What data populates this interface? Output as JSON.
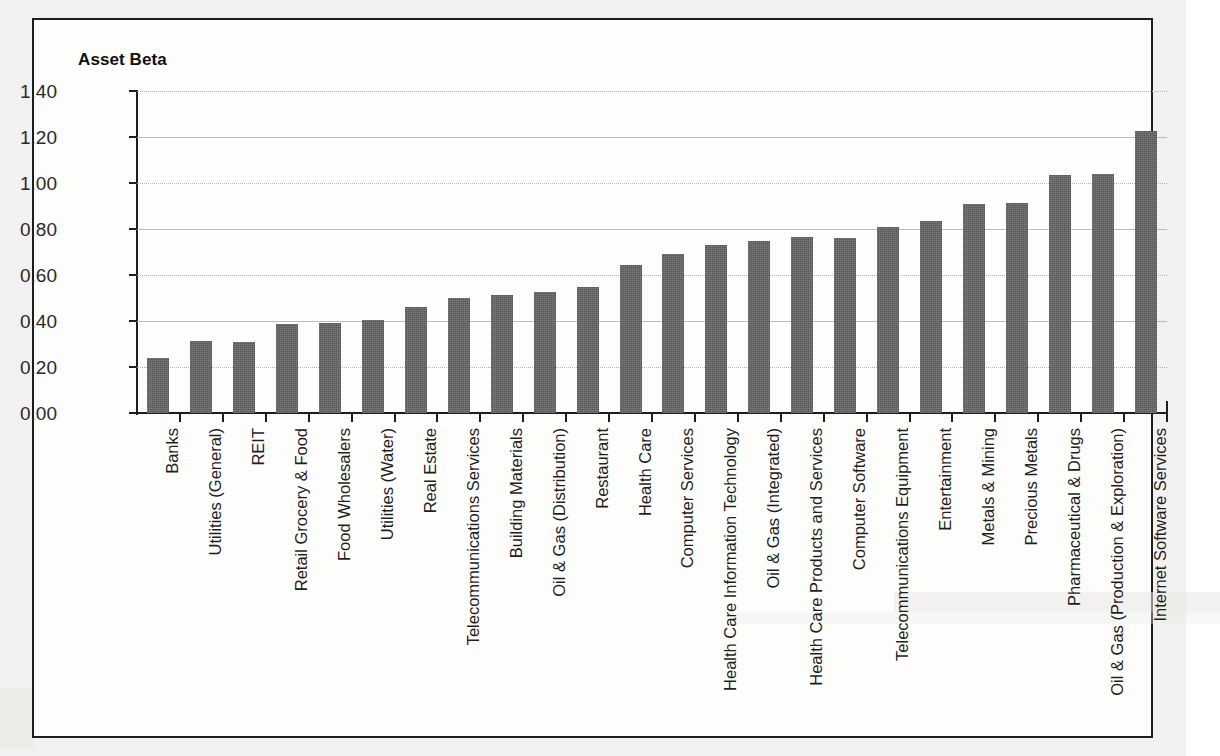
{
  "chart": {
    "title": "Asset Beta"
  },
  "chart_data": {
    "type": "bar",
    "title": "Asset Beta",
    "xlabel": "",
    "ylabel": "Asset Beta",
    "ylim": [
      0.0,
      1.4
    ],
    "ytick_labels": [
      "1.40",
      "1.20",
      "1.00",
      "0.80",
      "0.60",
      "0.40",
      "0.20",
      "0.00"
    ],
    "ytick_values": [
      1.4,
      1.2,
      1.0,
      0.8,
      0.6,
      0.4,
      0.2,
      0.0
    ],
    "grid": true,
    "legend": null,
    "bar_color": "#59585a",
    "categories": [
      "Banks",
      "Utilities (General)",
      "REIT",
      "Retail Grocery & Food",
      "Food Wholesalers",
      "Utilities (Water)",
      "Real Estate",
      "Telecommunications Services",
      "Building Materials",
      "Oil & Gas (Distribution)",
      "Restaurant",
      "Health Care",
      "Computer Services",
      "Health Care Information Technology",
      "Oil & Gas (Integrated)",
      "Health Care Products and Services",
      "Computer Software",
      "Telecommunications Equipment",
      "Entertainment",
      "Metals & Mining",
      "Precious Metals",
      "Pharmaceutical & Drugs",
      "Oil & Gas (Production & Exploration)",
      "Internet Software Services"
    ],
    "values": [
      0.24,
      0.315,
      0.31,
      0.385,
      0.39,
      0.405,
      0.46,
      0.5,
      0.515,
      0.525,
      0.55,
      0.645,
      0.69,
      0.73,
      0.75,
      0.765,
      0.76,
      0.81,
      0.835,
      0.91,
      0.915,
      1.035,
      1.04,
      1.225
    ]
  }
}
